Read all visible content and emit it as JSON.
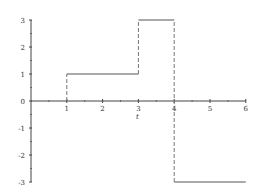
{
  "chart_data": {
    "type": "line",
    "title": "",
    "xlabel": "t",
    "ylabel": "",
    "xlim": [
      0,
      6
    ],
    "ylim": [
      -3,
      3
    ],
    "x_ticks": [
      "1",
      "2",
      "3",
      "4",
      "5",
      "6"
    ],
    "y_ticks": [
      "3",
      "2",
      "1",
      "0",
      "-1",
      "-2",
      "-3"
    ],
    "grid": false,
    "series": [
      {
        "name": "step function",
        "segments": [
          {
            "x": [
              1,
              3
            ],
            "y": 1
          },
          {
            "x": [
              3,
              4
            ],
            "y": 3
          },
          {
            "x": [
              4,
              6
            ],
            "y": -3
          }
        ]
      }
    ],
    "dashed_verticals": [
      {
        "x": 1,
        "y": [
          0,
          1
        ]
      },
      {
        "x": 3,
        "y": [
          1,
          3
        ]
      },
      {
        "x": 4,
        "y": [
          -3,
          3
        ]
      }
    ]
  }
}
